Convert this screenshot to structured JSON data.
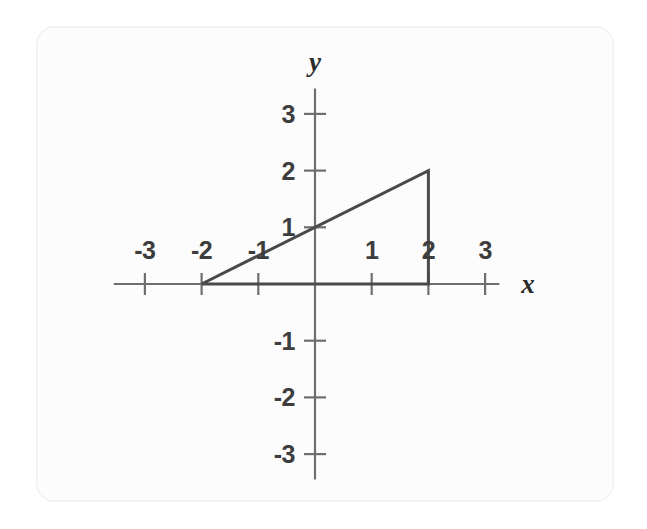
{
  "figure": {
    "kind": "coordinate-plane-with-triangle",
    "background_color": "#ffffff",
    "card_color": "#fcfcfc",
    "axis_color": "#6e6e6e",
    "shape_color": "#4a4a4a",
    "label_color": "#3d3d3d"
  },
  "chart_data": {
    "type": "scatter",
    "title": "",
    "subtitle": "",
    "xlabel": "x",
    "ylabel": "y",
    "xlim": [
      -3.55,
      3.25
    ],
    "ylim": [
      -3.45,
      3.45
    ],
    "grid": false,
    "legend": null,
    "axis_style": "cartesian-cross-through-origin",
    "x_ticks": [
      -3,
      -2,
      -1,
      1,
      2,
      3
    ],
    "x_tick_labels": [
      "-3",
      "-2",
      "-1",
      "1",
      "2",
      "3"
    ],
    "y_ticks": [
      -3,
      -2,
      -1,
      1,
      2,
      3
    ],
    "y_tick_labels": [
      "-3",
      "-2",
      "-1",
      "1",
      "2",
      "3"
    ],
    "x_tick_label_position": "above-axis",
    "y_tick_label_position": "left-of-axis",
    "origin": [
      0,
      0
    ],
    "unit_px": 56.7,
    "series": [
      {
        "name": "right-triangle",
        "type": "polygon",
        "closed": true,
        "filled": false,
        "stroke_width_px": 3,
        "vertices": [
          {
            "label": "A",
            "x": -2,
            "y": 0
          },
          {
            "label": "B",
            "x": 2,
            "y": 0
          },
          {
            "label": "C",
            "x": 2,
            "y": 2
          }
        ],
        "edges": [
          {
            "name": "base",
            "from": [
              -2,
              0
            ],
            "to": [
              2,
              0
            ],
            "length": 4
          },
          {
            "name": "vertical-leg",
            "from": [
              2,
              0
            ],
            "to": [
              2,
              2
            ],
            "length": 2
          },
          {
            "name": "hypotenuse",
            "from": [
              2,
              2
            ],
            "to": [
              -2,
              0
            ],
            "slope": 0.5,
            "y_intercept": 1
          }
        ]
      }
    ],
    "annotations": [
      {
        "text": "hypotenuse crosses the y-axis at y = 1",
        "x": 0,
        "y": 1
      }
    ]
  }
}
